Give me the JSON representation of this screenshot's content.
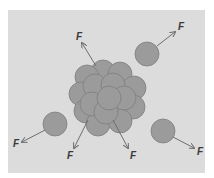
{
  "diagram": {
    "colors": {
      "page_background": "#ffffff",
      "panel_background": "#dcdcdc",
      "nucleon_fill": "#9b9b9b",
      "nucleon_stroke": "#7e7e7e",
      "arrow": "#6e6e6e",
      "label": "#3a3a3a"
    },
    "panel": {
      "x": 8,
      "y": 10,
      "width": 197,
      "height": 163
    },
    "nucleus": {
      "label": "nucleus",
      "nucleons": [
        {
          "cx": 103,
          "cy": 72,
          "r": 12
        },
        {
          "cx": 120,
          "cy": 74,
          "r": 12
        },
        {
          "cx": 87,
          "cy": 77,
          "r": 12
        },
        {
          "cx": 134,
          "cy": 88,
          "r": 12
        },
        {
          "cx": 81,
          "cy": 94,
          "r": 12
        },
        {
          "cx": 133,
          "cy": 107,
          "r": 12
        },
        {
          "cx": 86,
          "cy": 111,
          "r": 12
        },
        {
          "cx": 98,
          "cy": 124,
          "r": 12
        },
        {
          "cx": 120,
          "cy": 121,
          "r": 12
        },
        {
          "cx": 95,
          "cy": 86,
          "r": 12
        },
        {
          "cx": 113,
          "cy": 85,
          "r": 12
        },
        {
          "cx": 124,
          "cy": 98,
          "r": 12
        },
        {
          "cx": 92,
          "cy": 104,
          "r": 12
        },
        {
          "cx": 106,
          "cy": 112,
          "r": 12
        },
        {
          "cx": 109,
          "cy": 98,
          "r": 12
        }
      ]
    },
    "free_nucleons": [
      {
        "cx": 147,
        "cy": 54,
        "r": 12
      },
      {
        "cx": 55,
        "cy": 124,
        "r": 12
      },
      {
        "cx": 163,
        "cy": 131,
        "r": 12
      }
    ],
    "forces": [
      {
        "label": "F",
        "x1": 96,
        "y1": 66,
        "x2": 82,
        "y2": 43,
        "lx": 76,
        "ly": 40
      },
      {
        "label": "F",
        "x1": 157,
        "y1": 46,
        "x2": 175,
        "y2": 32,
        "lx": 178,
        "ly": 30
      },
      {
        "label": "F",
        "x1": 45,
        "y1": 130,
        "x2": 22,
        "y2": 142,
        "lx": 13,
        "ly": 147
      },
      {
        "label": "F",
        "x1": 88,
        "y1": 120,
        "x2": 74,
        "y2": 148,
        "lx": 67,
        "ly": 159
      },
      {
        "label": "F",
        "x1": 113,
        "y1": 120,
        "x2": 128,
        "y2": 148,
        "lx": 130,
        "ly": 159
      },
      {
        "label": "F",
        "x1": 173,
        "y1": 137,
        "x2": 194,
        "y2": 148,
        "lx": 197,
        "ly": 155
      }
    ]
  }
}
